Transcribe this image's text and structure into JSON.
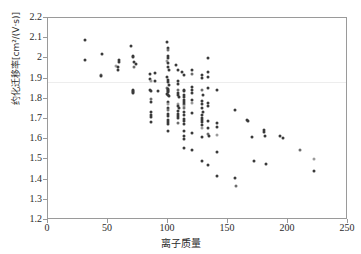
{
  "chart_data": {
    "type": "scatter",
    "title": "",
    "xlabel": "离子质量",
    "ylabel": "约化迁移率[cm²/(V·s)]",
    "xlim": [
      0,
      250
    ],
    "ylim": [
      1.2,
      2.2
    ],
    "xticks": [
      "0",
      "50",
      "100",
      "150",
      "200",
      "250"
    ],
    "xtick_values": [
      0,
      50,
      100,
      150,
      200,
      250
    ],
    "yticks": [
      "1.2",
      "1.3",
      "1.4",
      "1.5",
      "1.6",
      "1.7",
      "1.8",
      "1.9",
      "2",
      "2.1",
      "2.2"
    ],
    "ytick_values": [
      1.2,
      1.3,
      1.4,
      1.5,
      1.6,
      1.7,
      1.8,
      1.9,
      2.0,
      2.1,
      2.2
    ],
    "grid": false,
    "legend": null,
    "marker_color": "#3a3a3a",
    "marker_size_px": 3,
    "series": [
      {
        "name": "离子",
        "points": [
          [
            31,
            2.09
          ],
          [
            31,
            1.99
          ],
          [
            45,
            2.02
          ],
          [
            44,
            1.92
          ],
          [
            44,
            1.915
          ],
          [
            57,
            1.96
          ],
          [
            58,
            1.955
          ],
          [
            58,
            1.945
          ],
          [
            59,
            1.99
          ],
          [
            59,
            1.98
          ],
          [
            69,
            2.06
          ],
          [
            71,
            2.01
          ],
          [
            71,
            2.005
          ],
          [
            72,
            1.98
          ],
          [
            72,
            1.955
          ],
          [
            73,
            1.97
          ],
          [
            71,
            1.845
          ],
          [
            71,
            1.84
          ],
          [
            71,
            1.835
          ],
          [
            71,
            1.83
          ],
          [
            85,
            1.925
          ],
          [
            85,
            1.9
          ],
          [
            86,
            1.89
          ],
          [
            85,
            1.845
          ],
          [
            86,
            1.84
          ],
          [
            86,
            1.8
          ],
          [
            86,
            1.785
          ],
          [
            86,
            1.735
          ],
          [
            86,
            1.72
          ],
          [
            86,
            1.71
          ],
          [
            86,
            1.685
          ],
          [
            89,
            1.93
          ],
          [
            89,
            1.89
          ],
          [
            92,
            1.84
          ],
          [
            99,
            2.08
          ],
          [
            100,
            2.05
          ],
          [
            100,
            2.04
          ],
          [
            100,
            2.01
          ],
          [
            100,
            2.0
          ],
          [
            99,
            1.985
          ],
          [
            100,
            1.975
          ],
          [
            100,
            1.955
          ],
          [
            101,
            1.945
          ],
          [
            99,
            1.91
          ],
          [
            100,
            1.895
          ],
          [
            100,
            1.885
          ],
          [
            101,
            1.87
          ],
          [
            99,
            1.855
          ],
          [
            100,
            1.85
          ],
          [
            100,
            1.845
          ],
          [
            100,
            1.84
          ],
          [
            100,
            1.835
          ],
          [
            99,
            1.825
          ],
          [
            100,
            1.82
          ],
          [
            101,
            1.815
          ],
          [
            100,
            1.785
          ],
          [
            100,
            1.775
          ],
          [
            100,
            1.755
          ],
          [
            100,
            1.745
          ],
          [
            100,
            1.725
          ],
          [
            100,
            1.715
          ],
          [
            100,
            1.695
          ],
          [
            100,
            1.685
          ],
          [
            100,
            1.675
          ],
          [
            100,
            1.64
          ],
          [
            107,
            1.965
          ],
          [
            108,
            1.945
          ],
          [
            108,
            1.89
          ],
          [
            108,
            1.875
          ],
          [
            108,
            1.845
          ],
          [
            108,
            1.83
          ],
          [
            108,
            1.82
          ],
          [
            109,
            1.81
          ],
          [
            108,
            1.775
          ],
          [
            108,
            1.765
          ],
          [
            109,
            1.755
          ],
          [
            108,
            1.74
          ],
          [
            108,
            1.725
          ],
          [
            108,
            1.715
          ],
          [
            108,
            1.705
          ],
          [
            108,
            1.68
          ],
          [
            112,
            1.935
          ],
          [
            113,
            1.92
          ],
          [
            113,
            1.845
          ],
          [
            113,
            1.84
          ],
          [
            113,
            1.82
          ],
          [
            113,
            1.81
          ],
          [
            113,
            1.795
          ],
          [
            113,
            1.785
          ],
          [
            113,
            1.775
          ],
          [
            113,
            1.765
          ],
          [
            113,
            1.755
          ],
          [
            113,
            1.735
          ],
          [
            113,
            1.72
          ],
          [
            113,
            1.7
          ],
          [
            113,
            1.69
          ],
          [
            113,
            1.675
          ],
          [
            113,
            1.64
          ],
          [
            113,
            1.615
          ],
          [
            113,
            1.6
          ],
          [
            113,
            1.555
          ],
          [
            120,
            1.945
          ],
          [
            120,
            1.925
          ],
          [
            120,
            1.86
          ],
          [
            120,
            1.845
          ],
          [
            120,
            1.83
          ],
          [
            120,
            1.795
          ],
          [
            120,
            1.78
          ],
          [
            120,
            1.73
          ],
          [
            120,
            1.63
          ],
          [
            120,
            1.545
          ],
          [
            128,
            1.92
          ],
          [
            128,
            1.905
          ],
          [
            128,
            1.845
          ],
          [
            129,
            1.82
          ],
          [
            128,
            1.79
          ],
          [
            128,
            1.775
          ],
          [
            128,
            1.755
          ],
          [
            129,
            1.735
          ],
          [
            128,
            1.72
          ],
          [
            128,
            1.705
          ],
          [
            128,
            1.695
          ],
          [
            128,
            1.685
          ],
          [
            128,
            1.67
          ],
          [
            128,
            1.655
          ],
          [
            128,
            1.61
          ],
          [
            128,
            1.49
          ],
          [
            133,
            2.0
          ],
          [
            133,
            1.935
          ],
          [
            133,
            1.91
          ],
          [
            133,
            1.855
          ],
          [
            133,
            1.78
          ],
          [
            133,
            1.765
          ],
          [
            133,
            1.69
          ],
          [
            133,
            1.655
          ],
          [
            133,
            1.625
          ],
          [
            134,
            1.615
          ],
          [
            133,
            1.47
          ],
          [
            141,
            1.845
          ],
          [
            141,
            1.68
          ],
          [
            141,
            1.66
          ],
          [
            141,
            1.62
          ],
          [
            141,
            1.535
          ],
          [
            141,
            1.42
          ],
          [
            156,
            1.745
          ],
          [
            156,
            1.41
          ],
          [
            157,
            1.37
          ],
          [
            166,
            1.695
          ],
          [
            167,
            1.69
          ],
          [
            170,
            1.61
          ],
          [
            172,
            1.49
          ],
          [
            180,
            1.645
          ],
          [
            180,
            1.635
          ],
          [
            181,
            1.615
          ],
          [
            182,
            1.475
          ],
          [
            193,
            1.615
          ],
          [
            196,
            1.605
          ],
          [
            210,
            1.545
          ],
          [
            222,
            1.5
          ],
          [
            222,
            1.445
          ]
        ]
      }
    ]
  }
}
